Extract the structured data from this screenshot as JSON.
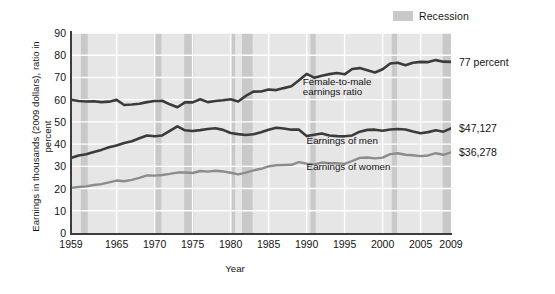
{
  "chart_data": {
    "type": "line",
    "title": "",
    "xlabel": "Year",
    "ylabel": "Earnings in thousands (2009 dollars), ratio in percent",
    "xlim": [
      1959,
      2009
    ],
    "ylim": [
      0,
      90
    ],
    "grid": true,
    "xticks": [
      1959,
      1965,
      1970,
      1975,
      1980,
      1985,
      1990,
      1995,
      2000,
      2005,
      2009
    ],
    "yticks": [
      0,
      10,
      20,
      30,
      40,
      50,
      60,
      70,
      80,
      90
    ],
    "legend": {
      "position": "top-right",
      "entries": [
        {
          "label": "Recession",
          "color": "#c9c9c9",
          "kind": "band"
        }
      ]
    },
    "x": [
      1959,
      1960,
      1961,
      1962,
      1963,
      1964,
      1965,
      1966,
      1967,
      1968,
      1969,
      1970,
      1971,
      1972,
      1973,
      1974,
      1975,
      1976,
      1977,
      1978,
      1979,
      1980,
      1981,
      1982,
      1983,
      1984,
      1985,
      1986,
      1987,
      1988,
      1989,
      1990,
      1991,
      1992,
      1993,
      1994,
      1995,
      1996,
      1997,
      1998,
      1999,
      2000,
      2001,
      2002,
      2003,
      2004,
      2005,
      2006,
      2007,
      2008,
      2009
    ],
    "series": [
      {
        "name": "Female-to-male earnings ratio",
        "color": "#3b3b3b",
        "width": 2.6,
        "unit": "percent",
        "end_label": "77 percent",
        "values": [
          60.0,
          59.4,
          59.2,
          59.3,
          58.9,
          59.1,
          59.9,
          57.6,
          57.8,
          58.2,
          58.9,
          59.4,
          59.5,
          57.9,
          56.6,
          58.8,
          58.8,
          60.2,
          58.9,
          59.4,
          59.7,
          60.2,
          59.2,
          61.7,
          63.6,
          63.7,
          64.6,
          64.3,
          65.2,
          66.0,
          68.7,
          71.6,
          69.9,
          70.8,
          71.5,
          72.0,
          71.4,
          73.8,
          74.2,
          73.2,
          72.2,
          73.7,
          76.3,
          76.6,
          75.5,
          76.6,
          77.0,
          76.9,
          77.8,
          77.1,
          77.0
        ]
      },
      {
        "name": "Earnings of men",
        "color": "#3b3b3b",
        "width": 2.6,
        "unit": "thousands of 2009 dollars",
        "end_label": "$47,127",
        "values": [
          33.8,
          34.9,
          35.4,
          36.5,
          37.4,
          38.6,
          39.4,
          40.5,
          41.3,
          42.6,
          43.9,
          43.5,
          43.9,
          46.0,
          48.0,
          46.2,
          45.9,
          46.3,
          46.8,
          47.1,
          46.4,
          45.0,
          44.5,
          44.1,
          44.4,
          45.3,
          46.5,
          47.4,
          47.0,
          46.5,
          46.5,
          43.6,
          44.2,
          44.8,
          43.9,
          43.6,
          43.5,
          43.9,
          45.6,
          46.4,
          46.5,
          46.0,
          46.6,
          46.8,
          46.6,
          45.7,
          44.9,
          45.4,
          46.2,
          45.6,
          47.1
        ]
      },
      {
        "name": "Earnings of women",
        "color": "#8c8c8c",
        "width": 2.4,
        "unit": "thousands of 2009 dollars",
        "end_label": "$36,278",
        "values": [
          20.3,
          20.7,
          21.0,
          21.6,
          22.0,
          22.8,
          23.6,
          23.3,
          23.9,
          24.8,
          25.9,
          25.8,
          26.1,
          26.6,
          27.2,
          27.2,
          27.0,
          27.9,
          27.6,
          28.0,
          27.7,
          27.1,
          26.4,
          27.2,
          28.2,
          28.9,
          30.0,
          30.5,
          30.6,
          30.7,
          31.9,
          31.2,
          30.9,
          31.7,
          31.4,
          31.4,
          31.1,
          32.4,
          33.8,
          34.0,
          33.6,
          33.9,
          35.5,
          35.9,
          35.2,
          35.0,
          34.6,
          34.9,
          35.9,
          35.2,
          36.3
        ]
      }
    ],
    "annotations": [
      {
        "text": "Female-to-male",
        "x": 1989.5,
        "y": 68.0
      },
      {
        "text": "earnings ratio",
        "x": 1989.5,
        "y": 63.5
      },
      {
        "text": "Earnings of men",
        "x": 1990.0,
        "y": 41.5
      },
      {
        "text": "Earnings of women",
        "x": 1990.0,
        "y": 29.5
      }
    ],
    "recession_bands": [
      {
        "start": 1960.3,
        "end": 1961.2
      },
      {
        "start": 1969.9,
        "end": 1970.9
      },
      {
        "start": 1973.9,
        "end": 1975.2
      },
      {
        "start": 1980.1,
        "end": 1980.6
      },
      {
        "start": 1981.5,
        "end": 1982.9
      },
      {
        "start": 1990.5,
        "end": 1991.2
      },
      {
        "start": 2001.2,
        "end": 2001.9
      },
      {
        "start": 2007.9,
        "end": 2009.5
      }
    ],
    "band_color": "#c9c9c9",
    "plot_background": "#e6e6e6",
    "grid_color": "#ffffff",
    "axis_color": "#3d3d3d"
  },
  "legend": {
    "recession_label": "Recession"
  },
  "axes": {
    "y_title": "Earnings in thousands (2009 dollars), ratio in percent",
    "x_title": "Year"
  },
  "end_labels": {
    "ratio": "77 percent",
    "men": "$47,127",
    "women": "$36,278"
  },
  "annotations": {
    "ratio_line1": "Female-to-male",
    "ratio_line2": "earnings ratio",
    "men": "Earnings of men",
    "women": "Earnings of women"
  }
}
